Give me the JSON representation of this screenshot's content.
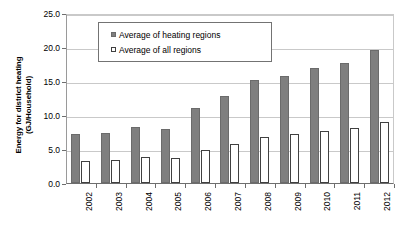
{
  "chart_data": {
    "type": "bar",
    "title": "",
    "xlabel": "",
    "ylabel": "Energy for district heating (GJ/Household)",
    "ylabel_line1": "Energy for district heating",
    "ylabel_line2": "(GJ/Household)",
    "ylim": [
      0.0,
      25.0
    ],
    "ytick_labels": [
      "25.0",
      "20.0",
      "15.0",
      "10.0",
      "5.0",
      "0.0"
    ],
    "ytick_values": [
      25.0,
      20.0,
      15.0,
      10.0,
      5.0,
      0.0
    ],
    "grid": true,
    "legend_position": "top-left-inside",
    "categories": [
      "2002",
      "2003",
      "2004",
      "2005",
      "2006",
      "2007",
      "2008",
      "2009",
      "2010",
      "2011",
      "2012"
    ],
    "series": [
      {
        "name": "Average of heating regions",
        "color": "#7f7f7f",
        "values": [
          7.2,
          7.4,
          8.2,
          8.0,
          11.0,
          12.8,
          15.1,
          15.8,
          16.9,
          17.7,
          19.6
        ]
      },
      {
        "name": "Average of all regions",
        "color": "#ffffff",
        "values": [
          3.3,
          3.4,
          3.8,
          3.7,
          4.9,
          5.8,
          6.8,
          7.2,
          7.7,
          8.1,
          8.9
        ]
      }
    ]
  },
  "legend": {
    "entries": [
      {
        "label": "Average of heating regions",
        "swatch": "filled-gray-square"
      },
      {
        "label": "Average of all regions",
        "swatch": "hollow-white-square"
      }
    ]
  },
  "colors": {
    "series_heating": "#7f7f7f",
    "series_all": "#ffffff",
    "gridline": "#c9c9c9",
    "axis": "#6e6e6e",
    "text": "#000000",
    "background": "#ffffff"
  }
}
